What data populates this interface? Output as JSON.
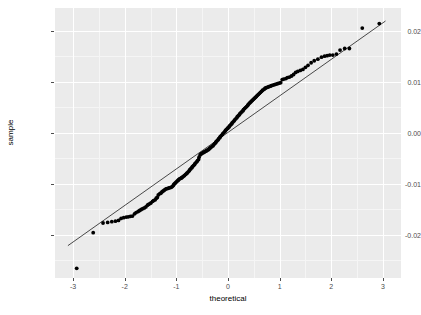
{
  "chart_data": {
    "type": "scatter",
    "title": "",
    "xlabel": "theoretical",
    "ylabel": "sample",
    "xlim": [
      -3.35,
      3.35
    ],
    "ylim": [
      -0.0285,
      0.0245
    ],
    "grid": true,
    "legend": null,
    "xticks": [
      -3,
      -2,
      -1,
      0,
      1,
      2,
      3
    ],
    "xticklabels": [
      "-3",
      "-2",
      "-1",
      "0",
      "1",
      "2",
      "3"
    ],
    "yticks": [
      0.02,
      0.01,
      0.0,
      -0.01,
      -0.02
    ],
    "yticklabels": [
      "0.02",
      "0.01",
      "0.00",
      "-0.01",
      "-0.02"
    ],
    "xminorticks": [
      -2.5,
      -1.5,
      -0.5,
      0.5,
      1.5,
      2.5
    ],
    "yminorticks": [
      0.015,
      0.005,
      -0.005,
      -0.015,
      -0.025
    ],
    "reference_line": {
      "name": "qq-line",
      "x": [
        -3.1,
        3.05
      ],
      "y": [
        -0.02215,
        0.02195
      ],
      "color": "#000000",
      "width": 0.7
    },
    "series": [
      {
        "name": "sample-quantiles",
        "marker": "filled-circle",
        "color": "#000000",
        "size": 1.9,
        "points": [
          [
            -2.93,
            -0.0266
          ],
          [
            -2.61,
            -0.0196
          ],
          [
            -2.42,
            -0.0177
          ],
          [
            -2.33,
            -0.0176
          ],
          [
            -2.25,
            -0.01745
          ],
          [
            -2.18,
            -0.01735
          ],
          [
            -2.12,
            -0.0172
          ],
          [
            -2.07,
            -0.0168
          ],
          [
            -2.02,
            -0.01665
          ],
          [
            -1.97,
            -0.01655
          ],
          [
            -1.93,
            -0.0165
          ],
          [
            -1.89,
            -0.0164
          ],
          [
            -1.85,
            -0.01635
          ],
          [
            -1.81,
            -0.0159
          ],
          [
            -1.78,
            -0.01565
          ],
          [
            -1.74,
            -0.01545
          ],
          [
            -1.71,
            -0.01525
          ],
          [
            -1.68,
            -0.01505
          ],
          [
            -1.65,
            -0.0149
          ],
          [
            -1.62,
            -0.01475
          ],
          [
            -1.59,
            -0.01455
          ],
          [
            -1.56,
            -0.0142
          ],
          [
            -1.54,
            -0.01405
          ],
          [
            -1.51,
            -0.0139
          ],
          [
            -1.49,
            -0.01375
          ],
          [
            -1.46,
            -0.01345
          ],
          [
            -1.44,
            -0.0133
          ],
          [
            -1.41,
            -0.01315
          ],
          [
            -1.39,
            -0.01285
          ],
          [
            -1.37,
            -0.0127
          ],
          [
            -1.35,
            -0.0122
          ],
          [
            -1.32,
            -0.01195
          ],
          [
            -1.3,
            -0.01185
          ],
          [
            -1.28,
            -0.0116
          ],
          [
            -1.26,
            -0.01145
          ],
          [
            -1.24,
            -0.0113
          ],
          [
            -1.22,
            -0.01115
          ],
          [
            -1.2,
            -0.011
          ],
          [
            -1.18,
            -0.01095
          ],
          [
            -1.16,
            -0.0109
          ],
          [
            -1.14,
            -0.0108
          ],
          [
            -1.12,
            -0.01075
          ],
          [
            -1.1,
            -0.0107
          ],
          [
            -1.08,
            -0.01055
          ],
          [
            -1.06,
            -0.01035
          ],
          [
            -1.05,
            -0.01015
          ],
          [
            -1.03,
            -0.00995
          ],
          [
            -1.01,
            -0.00975
          ],
          [
            -0.99,
            -0.00955
          ],
          [
            -0.97,
            -0.00935
          ],
          [
            -0.96,
            -0.00925
          ],
          [
            -0.94,
            -0.00905
          ],
          [
            -0.92,
            -0.00895
          ],
          [
            -0.9,
            -0.00885
          ],
          [
            -0.89,
            -0.00875
          ],
          [
            -0.87,
            -0.0086
          ],
          [
            -0.85,
            -0.00845
          ],
          [
            -0.84,
            -0.00835
          ],
          [
            -0.82,
            -0.00815
          ],
          [
            -0.8,
            -0.008
          ],
          [
            -0.79,
            -0.00785
          ],
          [
            -0.77,
            -0.00765
          ],
          [
            -0.75,
            -0.00745
          ],
          [
            -0.74,
            -0.00725
          ],
          [
            -0.72,
            -0.00705
          ],
          [
            -0.7,
            -0.00685
          ],
          [
            -0.69,
            -0.00665
          ],
          [
            -0.67,
            -0.00645
          ],
          [
            -0.65,
            -0.00625
          ],
          [
            -0.64,
            -0.00605
          ],
          [
            -0.62,
            -0.00585
          ],
          [
            -0.6,
            -0.00565
          ],
          [
            -0.59,
            -0.00545
          ],
          [
            -0.57,
            -0.00525
          ],
          [
            -0.56,
            -0.0048
          ],
          [
            -0.54,
            -0.00435
          ],
          [
            -0.52,
            -0.00415
          ],
          [
            -0.51,
            -0.00405
          ],
          [
            -0.49,
            -0.00395
          ],
          [
            -0.47,
            -0.00385
          ],
          [
            -0.46,
            -0.00375
          ],
          [
            -0.44,
            -0.00365
          ],
          [
            -0.42,
            -0.00355
          ],
          [
            -0.41,
            -0.00345
          ],
          [
            -0.39,
            -0.00335
          ],
          [
            -0.37,
            -0.00325
          ],
          [
            -0.36,
            -0.00305
          ],
          [
            -0.34,
            -0.00295
          ],
          [
            -0.33,
            -0.00285
          ],
          [
            -0.31,
            -0.00265
          ],
          [
            -0.29,
            -0.00255
          ],
          [
            -0.28,
            -0.00235
          ],
          [
            -0.26,
            -0.00215
          ],
          [
            -0.24,
            -0.00195
          ],
          [
            -0.23,
            -0.00175
          ],
          [
            -0.21,
            -0.00155
          ],
          [
            -0.19,
            -0.00135
          ],
          [
            -0.18,
            -0.00115
          ],
          [
            -0.16,
            -0.00095
          ],
          [
            -0.15,
            -0.00075
          ],
          [
            -0.13,
            -0.00055
          ],
          [
            -0.11,
            -0.00035
          ],
          [
            -0.1,
            -0.00015
          ],
          [
            -0.08,
            5e-05
          ],
          [
            -0.06,
            0.00025
          ],
          [
            -0.05,
            0.00045
          ],
          [
            -0.03,
            0.00065
          ],
          [
            -0.01,
            0.00085
          ],
          [
            0.0,
            0.00095
          ],
          [
            0.02,
            0.00115
          ],
          [
            0.03,
            0.00135
          ],
          [
            0.05,
            0.00155
          ],
          [
            0.07,
            0.00175
          ],
          [
            0.08,
            0.00195
          ],
          [
            0.1,
            0.00215
          ],
          [
            0.12,
            0.00235
          ],
          [
            0.13,
            0.00255
          ],
          [
            0.15,
            0.00275
          ],
          [
            0.17,
            0.00295
          ],
          [
            0.18,
            0.00315
          ],
          [
            0.2,
            0.00335
          ],
          [
            0.22,
            0.00355
          ],
          [
            0.23,
            0.00375
          ],
          [
            0.25,
            0.00395
          ],
          [
            0.27,
            0.00415
          ],
          [
            0.29,
            0.00435
          ],
          [
            0.3,
            0.00455
          ],
          [
            0.32,
            0.00475
          ],
          [
            0.34,
            0.00495
          ],
          [
            0.36,
            0.00515
          ],
          [
            0.38,
            0.00535
          ],
          [
            0.39,
            0.00555
          ],
          [
            0.41,
            0.00575
          ],
          [
            0.43,
            0.00595
          ],
          [
            0.45,
            0.00615
          ],
          [
            0.47,
            0.00635
          ],
          [
            0.49,
            0.00655
          ],
          [
            0.51,
            0.00675
          ],
          [
            0.53,
            0.00695
          ],
          [
            0.55,
            0.00715
          ],
          [
            0.57,
            0.00735
          ],
          [
            0.59,
            0.00755
          ],
          [
            0.61,
            0.00775
          ],
          [
            0.63,
            0.00795
          ],
          [
            0.65,
            0.00815
          ],
          [
            0.67,
            0.00835
          ],
          [
            0.7,
            0.00855
          ],
          [
            0.72,
            0.00875
          ],
          [
            0.74,
            0.00885
          ],
          [
            0.77,
            0.00895
          ],
          [
            0.79,
            0.00905
          ],
          [
            0.82,
            0.00915
          ],
          [
            0.84,
            0.00925
          ],
          [
            0.87,
            0.00935
          ],
          [
            0.9,
            0.00945
          ],
          [
            0.93,
            0.00955
          ],
          [
            0.96,
            0.00965
          ],
          [
            0.99,
            0.00975
          ],
          [
            1.02,
            0.00985
          ],
          [
            1.05,
            0.01045
          ],
          [
            1.08,
            0.01055
          ],
          [
            1.12,
            0.01065
          ],
          [
            1.15,
            0.01085
          ],
          [
            1.19,
            0.01095
          ],
          [
            1.23,
            0.01115
          ],
          [
            1.27,
            0.01145
          ],
          [
            1.31,
            0.01185
          ],
          [
            1.35,
            0.01205
          ],
          [
            1.4,
            0.01225
          ],
          [
            1.45,
            0.01245
          ],
          [
            1.5,
            0.01285
          ],
          [
            1.55,
            0.01325
          ],
          [
            1.61,
            0.01375
          ],
          [
            1.67,
            0.01415
          ],
          [
            1.74,
            0.01445
          ],
          [
            1.81,
            0.01485
          ],
          [
            1.87,
            0.01505
          ],
          [
            1.92,
            0.01515
          ],
          [
            1.97,
            0.01525
          ],
          [
            2.03,
            0.01525
          ],
          [
            2.1,
            0.01545
          ],
          [
            2.17,
            0.01625
          ],
          [
            2.26,
            0.01655
          ],
          [
            2.35,
            0.01655
          ],
          [
            2.6,
            0.02055
          ],
          [
            2.93,
            0.02145
          ]
        ]
      }
    ]
  },
  "axes": {
    "x_title": "theoretical",
    "y_title": "sample"
  },
  "theme": {
    "panel_background": "#ebebeb",
    "major_grid": "#ffffff",
    "minor_grid": "#f5f5f5",
    "point_color": "#000000",
    "line_color": "#000000",
    "tick_text_color": "#4d4d4d",
    "axis_title_color": "#000000",
    "plot_background": "#ffffff"
  }
}
